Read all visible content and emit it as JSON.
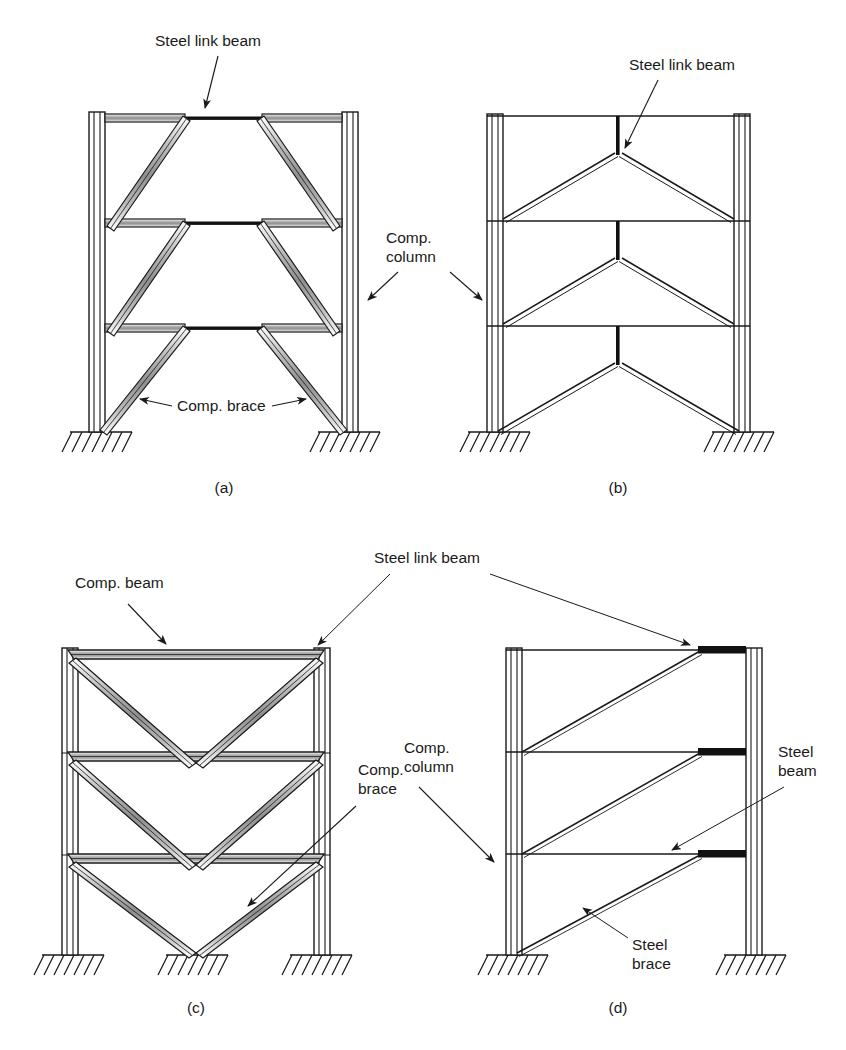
{
  "figure": {
    "background_color": "#ffffff",
    "line_color": "#1a1a1a",
    "steel_link_color": "#000000",
    "composite_fill_color": "#c8c8c8"
  },
  "labels": {
    "steel_link_beam_a": "Steel link beam",
    "comp_column_ab": "Comp.\ncolumn",
    "comp_column_ab_line1": "Comp.",
    "comp_column_ab_line2": "column",
    "comp_brace_a": "Comp. brace",
    "steel_link_beam_b": "Steel link beam",
    "comp_beam_c": "Comp. beam",
    "steel_link_beam_cd": "Steel link beam",
    "comp_column_cd_line1": "Comp.",
    "comp_column_cd_line2": "column",
    "comp_brace_c_line1": "Comp.",
    "comp_brace_c_line2": "brace",
    "steel_beam_d_line1": "Steel",
    "steel_beam_d_line2": "beam",
    "steel_brace_d_line1": "Steel",
    "steel_brace_d_line2": "brace"
  },
  "panels": [
    {
      "id": "a",
      "caption": "(a)",
      "description": "Composite frame with diagonal composite braces and central steel link beams",
      "frame": {
        "left": 89,
        "right": 358,
        "top": 117,
        "base": 432
      },
      "floor_levels": [
        117,
        222,
        327
      ],
      "column_width": 16,
      "supports": [
        {
          "x": 97,
          "y": 432
        },
        {
          "x": 350,
          "y": 432
        }
      ],
      "annotations": [
        "steel-link-beam",
        "comp-column",
        "comp-brace"
      ]
    },
    {
      "id": "b",
      "caption": "(b)",
      "description": "Steel frame with chevron braces and vertical steel link beams",
      "frame": {
        "left": 487,
        "right": 750,
        "top": 117,
        "base": 432
      },
      "floor_levels": [
        117,
        222,
        327
      ],
      "column_width": 16,
      "supports": [
        {
          "x": 495,
          "y": 432
        },
        {
          "x": 742,
          "y": 432
        }
      ],
      "annotations": [
        "steel-link-beam",
        "comp-column"
      ]
    },
    {
      "id": "c",
      "caption": "(c)",
      "description": "Composite frame with inverted-V composite braces and composite beams",
      "frame": {
        "left": 62,
        "right": 330,
        "top": 650,
        "base": 955
      },
      "floor_levels": [
        650,
        752,
        854
      ],
      "column_width": 16,
      "supports": [
        {
          "x": 70,
          "y": 955
        },
        {
          "x": 196,
          "y": 955
        },
        {
          "x": 322,
          "y": 955
        }
      ],
      "annotations": [
        "comp-beam",
        "steel-link-beam",
        "comp-column",
        "comp-brace"
      ]
    },
    {
      "id": "d",
      "caption": "(d)",
      "description": "Steel frame with single diagonal steel braces and eccentric steel link beams",
      "frame": {
        "left": 506,
        "right": 762,
        "top": 650,
        "base": 955
      },
      "floor_levels": [
        650,
        752,
        854
      ],
      "column_width": 16,
      "supports": [
        {
          "x": 514,
          "y": 955
        },
        {
          "x": 754,
          "y": 955
        }
      ],
      "annotations": [
        "steel-link-beam",
        "steel-beam",
        "steel-brace"
      ]
    }
  ],
  "captions": {
    "a": "(a)",
    "b": "(b)",
    "c": "(c)",
    "d": "(d)"
  }
}
